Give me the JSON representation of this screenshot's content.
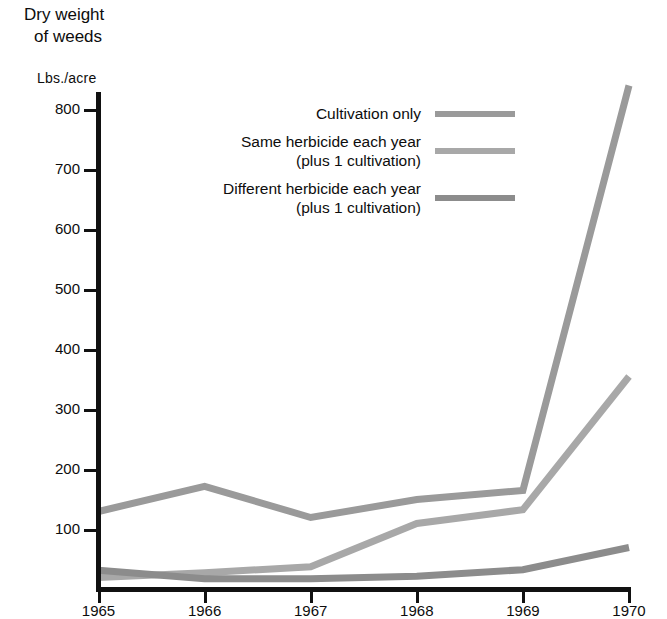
{
  "header": {
    "title_line1": "Dry weight",
    "title_line2": "of weeds",
    "unit_label": "Lbs./acre"
  },
  "legend": {
    "items": [
      {
        "label": "Cultivation only",
        "sub": "",
        "color": "#9a9a9a"
      },
      {
        "label": "Same herbicide each year",
        "sub": "(plus 1 cultivation)",
        "color": "#a8a8a8"
      },
      {
        "label": "Different herbicide each year",
        "sub": "(plus 1 cultivation)",
        "color": "#8c8c8c"
      }
    ]
  },
  "axes": {
    "y_ticks": [
      "800",
      "700",
      "600",
      "500",
      "400",
      "300",
      "200",
      "100"
    ],
    "x_ticks": [
      "1965",
      "1966",
      "1967",
      "1968",
      "1969",
      "1970"
    ]
  },
  "chart_data": {
    "type": "line",
    "title": "Dry weight of weeds",
    "xlabel": "",
    "ylabel": "Lbs./acre",
    "x": [
      1965,
      1966,
      1967,
      1968,
      1969,
      1970
    ],
    "categories": [
      "1965",
      "1966",
      "1967",
      "1968",
      "1969",
      "1970"
    ],
    "ylim": [
      0,
      850
    ],
    "xlim": [
      1965,
      1970
    ],
    "yticks": [
      100,
      200,
      300,
      400,
      500,
      600,
      700,
      800
    ],
    "grid": false,
    "legend_position": "upper-center",
    "series": [
      {
        "name": "Cultivation only",
        "color": "#9a9a9a",
        "values": [
          130,
          172,
          120,
          150,
          165,
          840
        ]
      },
      {
        "name": "Same herbicide each year (plus 1 cultivation)",
        "color": "#a8a8a8",
        "values": [
          20,
          28,
          38,
          110,
          133,
          355
        ]
      },
      {
        "name": "Different herbicide each year (plus 1 cultivation)",
        "color": "#8c8c8c",
        "values": [
          32,
          18,
          18,
          22,
          33,
          70
        ]
      }
    ]
  }
}
